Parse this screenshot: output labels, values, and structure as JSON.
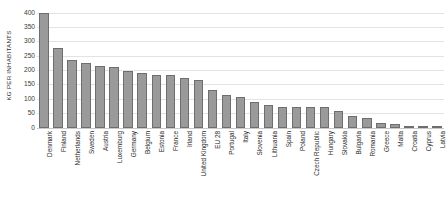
{
  "chart_data": {
    "type": "bar",
    "title": "",
    "subtitle": "",
    "xlabel": "",
    "ylabel": "KG PER INHABITANTS",
    "ylim": [
      0,
      400
    ],
    "ytick_labels": [
      "400",
      "350",
      "300",
      "250",
      "200",
      "150",
      "100",
      "50",
      "0"
    ],
    "yticks": [
      400,
      350,
      300,
      250,
      200,
      150,
      100,
      50,
      0
    ],
    "grid": true,
    "legend": null,
    "legend_position": "none",
    "bar_color": "#9a9a9a",
    "bar_border_color": "#6e6e6e",
    "gridline_color": "#e3e3e3",
    "categories": [
      "Denmark",
      "Finland",
      "Netherlands",
      "Sweden",
      "Austria",
      "Luxemburg",
      "Germany",
      "Belgium",
      "Estonia",
      "France",
      "Irland",
      "United Kingdom",
      "EU 28",
      "Portugal",
      "Italy",
      "Slovenia",
      "Lithuania",
      "Spain",
      "Poland",
      "Czech Republic",
      "Hungary",
      "Slovakia",
      "Bulgaria",
      "Romania",
      "Greece",
      "Malta",
      "Croatia",
      "Cyprus",
      "Latvia"
    ],
    "values": [
      400,
      277,
      236,
      224,
      213,
      211,
      195,
      188,
      184,
      183,
      172,
      166,
      130,
      112,
      105,
      90,
      78,
      72,
      70,
      70,
      71,
      56,
      40,
      34,
      15,
      12,
      5,
      4,
      3
    ]
  }
}
